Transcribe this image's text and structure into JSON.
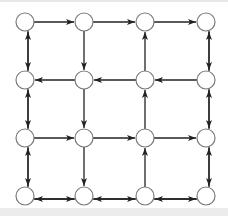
{
  "diagram": {
    "type": "directed-grid-graph",
    "rows": 4,
    "cols": 4,
    "node_x": [
      25,
      84,
      145,
      206
    ],
    "node_y": [
      22,
      80,
      138,
      196
    ],
    "node_radius": 9,
    "colors": {
      "node_stroke": "#7a7a7a",
      "node_fill": "#ffffff",
      "edge": "#222222",
      "background": "#ffffff"
    },
    "edges": [
      {
        "from": [
          0,
          0
        ],
        "to": [
          0,
          1
        ]
      },
      {
        "from": [
          0,
          1
        ],
        "to": [
          0,
          2
        ]
      },
      {
        "from": [
          0,
          2
        ],
        "to": [
          0,
          3
        ]
      },
      {
        "from": [
          1,
          1
        ],
        "to": [
          1,
          0
        ]
      },
      {
        "from": [
          1,
          2
        ],
        "to": [
          1,
          1
        ]
      },
      {
        "from": [
          1,
          3
        ],
        "to": [
          1,
          2
        ]
      },
      {
        "from": [
          2,
          0
        ],
        "to": [
          2,
          1
        ]
      },
      {
        "from": [
          2,
          1
        ],
        "to": [
          2,
          2
        ]
      },
      {
        "from": [
          2,
          2
        ],
        "to": [
          2,
          3
        ]
      },
      {
        "from": [
          3,
          0
        ],
        "to": [
          3,
          1
        ],
        "offset": 3
      },
      {
        "from": [
          3,
          1
        ],
        "to": [
          3,
          0
        ],
        "offset": -3
      },
      {
        "from": [
          3,
          1
        ],
        "to": [
          3,
          2
        ],
        "offset": 3
      },
      {
        "from": [
          3,
          2
        ],
        "to": [
          3,
          1
        ],
        "offset": -3
      },
      {
        "from": [
          3,
          2
        ],
        "to": [
          3,
          3
        ],
        "offset": 3
      },
      {
        "from": [
          3,
          3
        ],
        "to": [
          3,
          2
        ],
        "offset": -3
      },
      {
        "from": [
          0,
          0
        ],
        "to": [
          1,
          0
        ],
        "offset": -3
      },
      {
        "from": [
          1,
          0
        ],
        "to": [
          0,
          0
        ],
        "offset": 3
      },
      {
        "from": [
          1,
          0
        ],
        "to": [
          2,
          0
        ],
        "offset": -3
      },
      {
        "from": [
          2,
          0
        ],
        "to": [
          1,
          0
        ],
        "offset": 3
      },
      {
        "from": [
          2,
          0
        ],
        "to": [
          3,
          0
        ],
        "offset": -3
      },
      {
        "from": [
          3,
          0
        ],
        "to": [
          2,
          0
        ],
        "offset": 3
      },
      {
        "from": [
          0,
          1
        ],
        "to": [
          1,
          1
        ]
      },
      {
        "from": [
          1,
          1
        ],
        "to": [
          2,
          1
        ]
      },
      {
        "from": [
          2,
          1
        ],
        "to": [
          3,
          1
        ]
      },
      {
        "from": [
          3,
          2
        ],
        "to": [
          2,
          2
        ]
      },
      {
        "from": [
          2,
          2
        ],
        "to": [
          1,
          2
        ]
      },
      {
        "from": [
          1,
          2
        ],
        "to": [
          0,
          2
        ]
      },
      {
        "from": [
          0,
          3
        ],
        "to": [
          1,
          3
        ],
        "offset": -3
      },
      {
        "from": [
          1,
          3
        ],
        "to": [
          0,
          3
        ],
        "offset": 3
      },
      {
        "from": [
          1,
          3
        ],
        "to": [
          2,
          3
        ],
        "offset": -3
      },
      {
        "from": [
          2,
          3
        ],
        "to": [
          1,
          3
        ],
        "offset": 3
      },
      {
        "from": [
          2,
          3
        ],
        "to": [
          3,
          3
        ],
        "offset": -3
      },
      {
        "from": [
          3,
          3
        ],
        "to": [
          2,
          3
        ],
        "offset": 3
      }
    ]
  }
}
